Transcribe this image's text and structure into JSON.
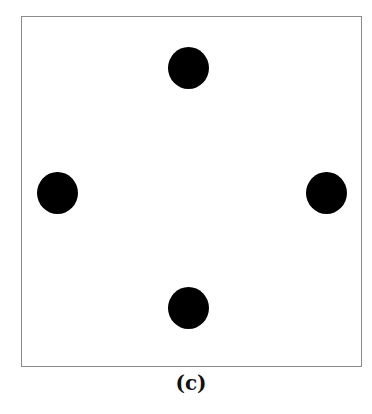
{
  "figure": {
    "caption": "(c)",
    "frame": {
      "left": 21,
      "top": 16,
      "right": 362,
      "bottom": 367,
      "border_color": "#8a8a8a"
    },
    "dot_color": "#000000",
    "dots": [
      {
        "name": "top",
        "cx": 188,
        "cy": 68
      },
      {
        "name": "left",
        "cx": 57,
        "cy": 193
      },
      {
        "name": "right",
        "cx": 326,
        "cy": 193
      },
      {
        "name": "bottom",
        "cx": 188,
        "cy": 308
      }
    ]
  }
}
